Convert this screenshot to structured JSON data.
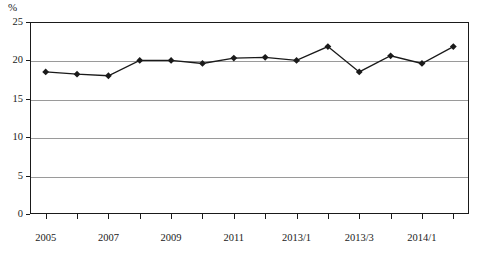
{
  "chart_data": {
    "type": "line",
    "title": "",
    "subtitle": "",
    "xlabel": "",
    "ylabel": "",
    "unit_label": "%",
    "ylim": [
      0,
      25
    ],
    "y_ticks": [
      0,
      5,
      10,
      15,
      20,
      25
    ],
    "grid": true,
    "legend": "none",
    "x_tick_labels": [
      "2005",
      "",
      "2007",
      "",
      "2009",
      "",
      "2011",
      "",
      "2013/1",
      "",
      "2013/3",
      "",
      "2014/1",
      ""
    ],
    "categories": [
      "2005",
      "2006",
      "2007",
      "2008",
      "2009",
      "2010",
      "2011",
      "2012",
      "2013/1",
      "2013/2",
      "2013/3",
      "2013/4",
      "2014/1",
      "2014/2"
    ],
    "values": [
      18.5,
      18.2,
      18.0,
      20.0,
      20.0,
      19.6,
      20.3,
      20.4,
      20.0,
      21.8,
      18.5,
      20.6,
      19.6,
      21.8
    ],
    "series": [
      {
        "name": "",
        "values": [
          18.5,
          18.2,
          18.0,
          20.0,
          20.0,
          19.6,
          20.3,
          20.4,
          20.0,
          21.8,
          18.5,
          20.6,
          19.6,
          21.8
        ],
        "color": "#1a1a1a",
        "marker": "diamond"
      }
    ]
  },
  "colors": {
    "line": "#1a1a1a",
    "marker": "#1a1a1a",
    "grid": "#9a9a9a",
    "frame": "#1a1a1a",
    "background": "#ffffff"
  }
}
